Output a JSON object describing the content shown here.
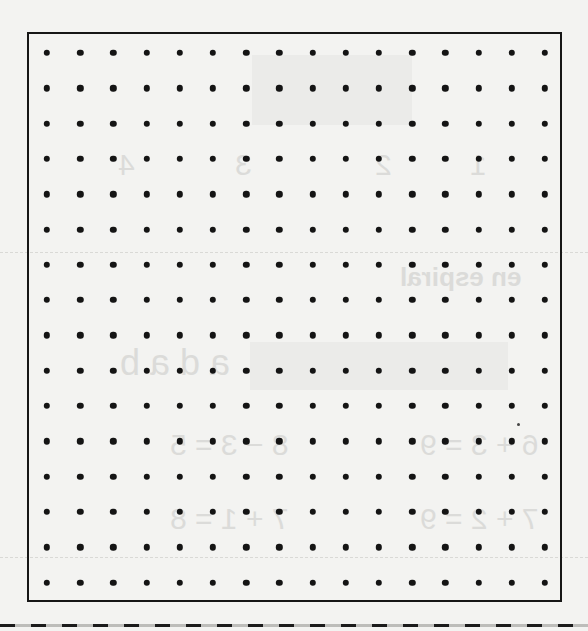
{
  "document": {
    "type": "dot-grid worksheet",
    "background_color": "#f3f3f1",
    "ink_color": "#141414"
  },
  "dot_grid": {
    "rows": 16,
    "columns": 16,
    "origin_x": 47,
    "origin_y": 53,
    "spacing_x": 33.2,
    "spacing_y": 35.3,
    "dot_diameter": 6.4
  },
  "frame": {
    "left": 27,
    "top": 32,
    "width": 535,
    "height": 570,
    "border_width": 2.5
  },
  "cut_line": {
    "style": "dashed",
    "y": 624,
    "dash_length": 15,
    "gap_length": 16
  },
  "show_through": {
    "heading": "en espiral",
    "numbers": [
      "1",
      "2",
      "3",
      "4"
    ],
    "equations": [
      "6 + 3 = 9",
      "8 − 3 = 5",
      "7 + 2 = 9",
      "7 + 1 = 8"
    ],
    "letters": "a d a b"
  }
}
